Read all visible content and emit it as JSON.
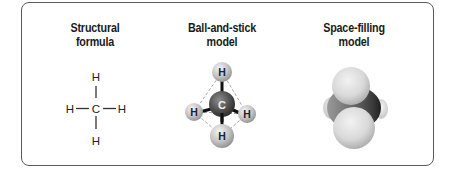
{
  "diagram": {
    "panels": [
      {
        "id": "structural-formula",
        "heading_line1": "Structural",
        "heading_line2": "formula",
        "atoms": {
          "top": "H",
          "left": "H",
          "center": "C",
          "right": "H",
          "bottom": "H"
        }
      },
      {
        "id": "ball-and-stick",
        "heading_line1": "Ball-and-stick",
        "heading_line2": "model",
        "atoms": {
          "top": "H",
          "left": "H",
          "center": "C",
          "right": "H",
          "bottom": "H"
        }
      },
      {
        "id": "space-filling",
        "heading_line1": "Space-filling",
        "heading_line2": "model"
      }
    ],
    "colors": {
      "frame_border": "#5a5a5a",
      "text": "#1a1a1a",
      "carbon": "#4a4a4a",
      "hydrogen": "#c8c8c8",
      "bond": "#111111",
      "dashed_edge": "#9a9a9a"
    }
  }
}
